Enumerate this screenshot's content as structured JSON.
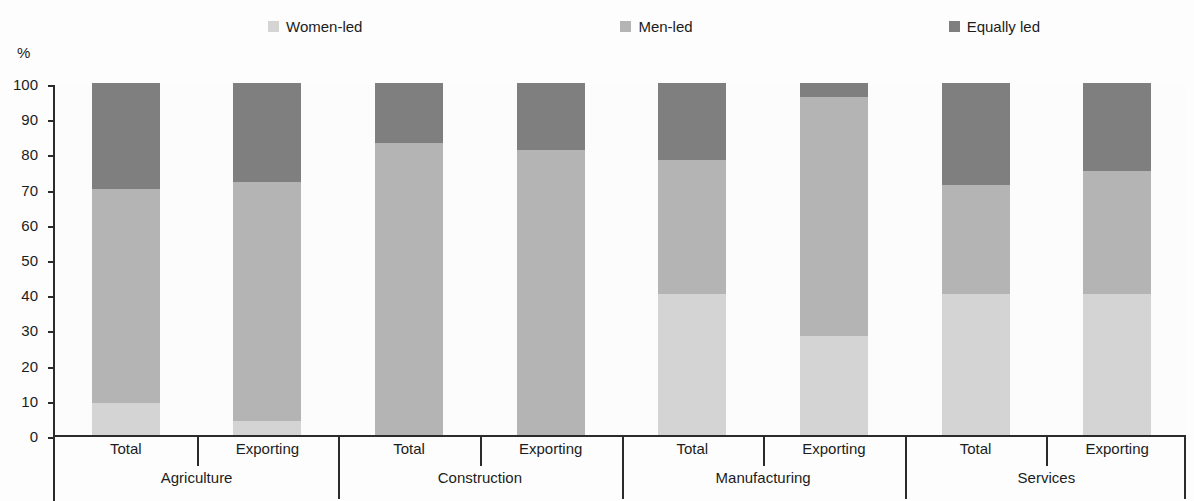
{
  "y_unit_label": "%",
  "legend": {
    "items": [
      {
        "label": "Women-led",
        "color": "#d4d4d4"
      },
      {
        "label": "Men-led",
        "color": "#b4b4b4"
      },
      {
        "label": "Equally led",
        "color": "#7f7f7f"
      }
    ]
  },
  "chart_data": {
    "type": "bar",
    "title": "",
    "subtitle": "",
    "stacked": true,
    "stack_total": 100,
    "xlabel": "",
    "ylabel": "%",
    "ylim": [
      0,
      100
    ],
    "yticks": [
      0,
      10,
      20,
      30,
      40,
      50,
      60,
      70,
      80,
      90,
      100
    ],
    "ytick_labels": [
      "0",
      "10",
      "20",
      "30",
      "40",
      "50",
      "60",
      "70",
      "80",
      "90",
      "100"
    ],
    "grid": false,
    "legend_position": "top",
    "groups": [
      "Agriculture",
      "Construction",
      "Manufacturing",
      "Services"
    ],
    "subcategories": [
      "Total",
      "Exporting"
    ],
    "categories": [
      "Agriculture Total",
      "Agriculture Exporting",
      "Construction Total",
      "Construction Exporting",
      "Manufacturing Total",
      "Manufacturing Exporting",
      "Services Total",
      "Services Exporting"
    ],
    "series": [
      {
        "name": "Women-led",
        "color": "#d4d4d4",
        "values": [
          9,
          4,
          0,
          0,
          40,
          28,
          40,
          40
        ]
      },
      {
        "name": "Men-led",
        "color": "#b4b4b4",
        "values": [
          61,
          68,
          83,
          81,
          38,
          68,
          31,
          35
        ]
      },
      {
        "name": "Equally led",
        "color": "#7f7f7f",
        "values": [
          30,
          28,
          17,
          19,
          22,
          4,
          29,
          25
        ]
      }
    ],
    "bars": [
      {
        "group": "Agriculture",
        "sub": "Total",
        "Women-led": 9,
        "Men-led": 61,
        "Equally led": 30
      },
      {
        "group": "Agriculture",
        "sub": "Exporting",
        "Women-led": 4,
        "Men-led": 68,
        "Equally led": 28
      },
      {
        "group": "Construction",
        "sub": "Total",
        "Women-led": 0,
        "Men-led": 83,
        "Equally led": 17
      },
      {
        "group": "Construction",
        "sub": "Exporting",
        "Women-led": 0,
        "Men-led": 81,
        "Equally led": 19
      },
      {
        "group": "Manufacturing",
        "sub": "Total",
        "Women-led": 40,
        "Men-led": 38,
        "Equally led": 22
      },
      {
        "group": "Manufacturing",
        "sub": "Exporting",
        "Women-led": 28,
        "Men-led": 68,
        "Equally led": 4
      },
      {
        "group": "Services",
        "sub": "Total",
        "Women-led": 40,
        "Men-led": 31,
        "Equally led": 29
      },
      {
        "group": "Services",
        "sub": "Exporting",
        "Women-led": 40,
        "Men-led": 35,
        "Equally led": 25
      }
    ]
  }
}
